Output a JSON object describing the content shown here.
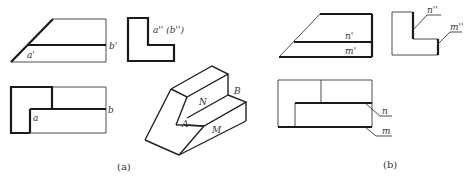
{
  "figure_a": {
    "caption": "(a)",
    "front_view": {
      "label_a": "a'",
      "label_b": "b'"
    },
    "side_view": {
      "label": "a'' (b'')"
    },
    "top_view": {
      "label_a": "a",
      "label_b": "b"
    },
    "isometric": {
      "label_N": "N",
      "label_B": "B",
      "label_A": "A",
      "label_M": "M"
    }
  },
  "figure_b": {
    "caption": "(b)",
    "front_view": {
      "label_n": "n'",
      "label_m": "m'"
    },
    "side_view": {
      "label_n": "n''",
      "label_m": "m''"
    },
    "top_view": {
      "label_n": "n",
      "label_m": "m"
    }
  }
}
